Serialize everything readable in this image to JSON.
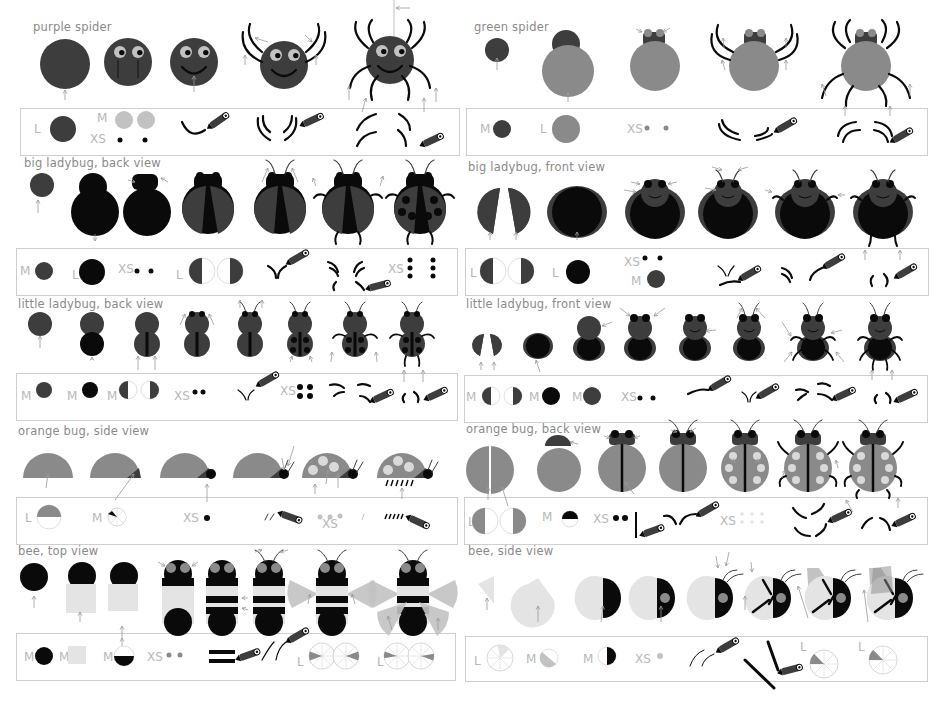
{
  "colors": {
    "body_dark": "#3d3d3d",
    "black": "#0a0a0a",
    "mid_gray": "#8a8a8a",
    "light_gray": "#c2c2c2",
    "pale_gray": "#e4e4e4",
    "spot_gray": "#d9d9d9",
    "arrow_gray": "#999999",
    "box_border": "#cfcfcf",
    "title_text": "#8a8a8a",
    "size_label": "#b8b8b8"
  },
  "sections": [
    {
      "id": "purple-spider",
      "title": "purple spider",
      "title_pos": [
        33,
        20
      ],
      "box": [
        20,
        108,
        438,
        46
      ],
      "size_labels": [
        {
          "text": "L",
          "x": 34,
          "y": 122
        },
        {
          "text": "M",
          "x": 97,
          "y": 111
        },
        {
          "text": "XS",
          "x": 90,
          "y": 132
        }
      ],
      "steps": 5
    },
    {
      "id": "green-spider",
      "title": "green spider",
      "title_pos": [
        474,
        20
      ],
      "box": [
        466,
        108,
        460,
        46
      ],
      "size_labels": [
        {
          "text": "M",
          "x": 480,
          "y": 122
        },
        {
          "text": "L",
          "x": 540,
          "y": 122
        },
        {
          "text": "XS",
          "x": 627,
          "y": 122
        }
      ],
      "steps": 5
    },
    {
      "id": "big-ladybug-back",
      "title": "big ladybug, back  view",
      "title_pos": [
        24,
        156
      ],
      "box": [
        16,
        248,
        440,
        46
      ],
      "size_labels": [
        {
          "text": "M",
          "x": 20,
          "y": 264
        },
        {
          "text": "L",
          "x": 72,
          "y": 268
        },
        {
          "text": "XS",
          "x": 118,
          "y": 262
        },
        {
          "text": "L",
          "x": 176,
          "y": 268
        },
        {
          "text": "XS",
          "x": 388,
          "y": 262
        }
      ],
      "steps": 7
    },
    {
      "id": "big-ladybug-front",
      "title": "big ladybug, front view",
      "title_pos": [
        468,
        160
      ],
      "box": [
        465,
        248,
        462,
        46
      ],
      "size_labels": [
        {
          "text": "L",
          "x": 470,
          "y": 266
        },
        {
          "text": "L",
          "x": 552,
          "y": 266
        },
        {
          "text": "XS",
          "x": 624,
          "y": 255
        },
        {
          "text": "M",
          "x": 631,
          "y": 274
        }
      ],
      "steps": 6
    },
    {
      "id": "little-ladybug-back",
      "title": "little ladybug, back view",
      "title_pos": [
        18,
        297
      ],
      "box": [
        16,
        373,
        440,
        46
      ],
      "size_labels": [
        {
          "text": "M",
          "x": 21,
          "y": 389
        },
        {
          "text": "M",
          "x": 67,
          "y": 389
        },
        {
          "text": "M",
          "x": 107,
          "y": 389
        },
        {
          "text": "XS",
          "x": 174,
          "y": 389
        },
        {
          "text": "XS",
          "x": 280,
          "y": 384
        }
      ],
      "steps": 8
    },
    {
      "id": "little-ladybug-front",
      "title": "little ladybug, front view",
      "title_pos": [
        466,
        297
      ],
      "box": [
        464,
        375,
        462,
        46
      ],
      "size_labels": [
        {
          "text": "M",
          "x": 466,
          "y": 390
        },
        {
          "text": "M",
          "x": 529,
          "y": 390
        },
        {
          "text": "M",
          "x": 572,
          "y": 390
        },
        {
          "text": "XS",
          "x": 621,
          "y": 390
        }
      ],
      "steps": 8
    },
    {
      "id": "orange-bug-side",
      "title": "orange bug, side view",
      "title_pos": [
        18,
        424
      ],
      "box": [
        16,
        497,
        440,
        46
      ],
      "size_labels": [
        {
          "text": "L",
          "x": 25,
          "y": 511
        },
        {
          "text": "M",
          "x": 92,
          "y": 511
        },
        {
          "text": "XS",
          "x": 183,
          "y": 511
        },
        {
          "text": "XS",
          "x": 322,
          "y": 517
        }
      ],
      "steps": 6
    },
    {
      "id": "orange-bug-back",
      "title": "orange bug, back view",
      "title_pos": [
        466,
        422
      ],
      "box": [
        464,
        497,
        462,
        46
      ],
      "size_labels": [
        {
          "text": "L",
          "x": 468,
          "y": 515
        },
        {
          "text": "M",
          "x": 542,
          "y": 510
        },
        {
          "text": "XS",
          "x": 593,
          "y": 512
        },
        {
          "text": "XS",
          "x": 720,
          "y": 514
        }
      ],
      "steps": 7
    },
    {
      "id": "bee-top",
      "title": "bee, top view",
      "title_pos": [
        18,
        544
      ],
      "box": [
        16,
        633,
        438,
        46
      ],
      "size_labels": [
        {
          "text": "M",
          "x": 24,
          "y": 650
        },
        {
          "text": "M",
          "x": 59,
          "y": 650
        },
        {
          "text": "M",
          "x": 103,
          "y": 650
        },
        {
          "text": "XS",
          "x": 147,
          "y": 650
        },
        {
          "text": "L",
          "x": 297,
          "y": 655
        },
        {
          "text": "L",
          "x": 377,
          "y": 655
        }
      ],
      "steps": 8
    },
    {
      "id": "bee-side",
      "title": "bee, side view",
      "title_pos": [
        468,
        544
      ],
      "box": [
        465,
        636,
        461,
        44
      ],
      "size_labels": [
        {
          "text": "L",
          "x": 474,
          "y": 654
        },
        {
          "text": "M",
          "x": 526,
          "y": 652
        },
        {
          "text": "M",
          "x": 583,
          "y": 652
        },
        {
          "text": "XS",
          "x": 635,
          "y": 652
        },
        {
          "text": "L",
          "x": 800,
          "y": 640
        },
        {
          "text": "L",
          "x": 858,
          "y": 640
        }
      ],
      "steps": 8
    }
  ],
  "legend": {
    "sizes": [
      "L",
      "M",
      "XS"
    ],
    "tool": "pencil-icon"
  }
}
